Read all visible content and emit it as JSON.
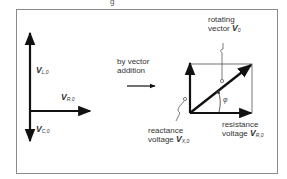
{
  "figure": {
    "top_fragment": "g",
    "left_diagram": {
      "labels": {
        "inductive": {
          "symbol": "V",
          "subscript": "L,0"
        },
        "resistive": {
          "symbol": "V",
          "subscript": "R,0"
        },
        "capacitive": {
          "symbol": "V",
          "subscript": "C,0"
        }
      }
    },
    "middle": {
      "line1": "by vector",
      "line2": "addition"
    },
    "right_diagram": {
      "rotating_vector": {
        "line1": "rotating",
        "line2_text": "vector ",
        "symbol": "V",
        "subscript": "0"
      },
      "angle": "φ",
      "reactance": {
        "line1": "reactance",
        "line2_text": "voltage ",
        "symbol": "V",
        "subscript": "X,0"
      },
      "resistance": {
        "line1": "resistance",
        "line2_text": "voltage ",
        "symbol": "V",
        "subscript": "R,0"
      }
    },
    "colors": {
      "ink": "#111111",
      "frame": "#8a8a8a",
      "rect": "#777777",
      "text": "#333333"
    }
  }
}
